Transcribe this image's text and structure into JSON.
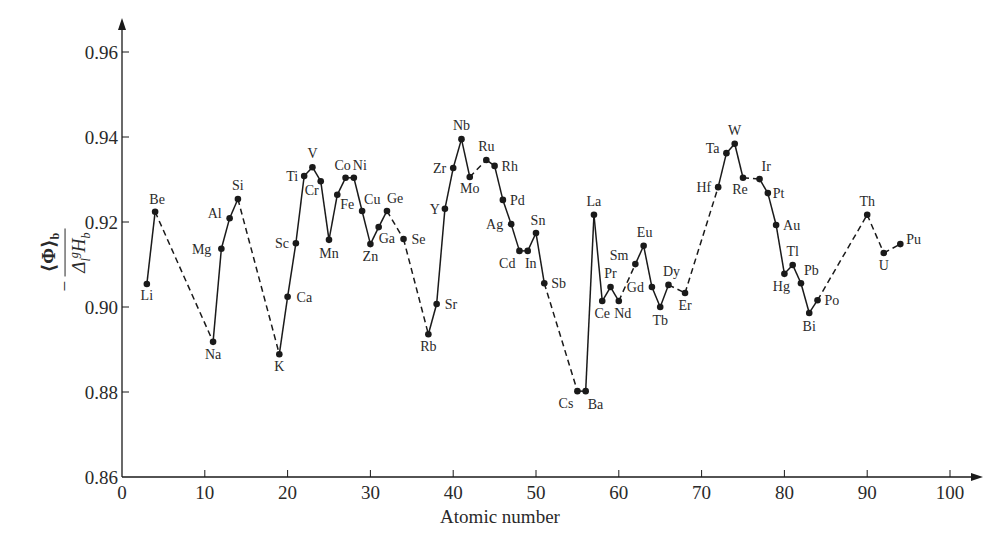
{
  "chart_data": {
    "type": "line",
    "title": "",
    "xlabel": "Atomic number",
    "ylabel": "−⟨Φ⟩_b / Δ_l^g H_b",
    "ylabel_parts": {
      "minus": "−",
      "numerator": "⟨Φ⟩",
      "numerator_sub": "b",
      "den_delta": "Δ",
      "den_sub": "l",
      "den_sup": "g",
      "den_H": "H",
      "den_H_sub": "b"
    },
    "xlim": [
      0,
      100
    ],
    "ylim": [
      0.86,
      0.96
    ],
    "xticks": [
      0,
      10,
      20,
      30,
      40,
      50,
      60,
      70,
      80,
      90,
      100
    ],
    "yticks": [
      0.86,
      0.88,
      0.9,
      0.92,
      0.94,
      0.96
    ],
    "ytick_labels": [
      "0.86",
      "0.88",
      "0.90",
      "0.92",
      "0.94",
      "0.96"
    ],
    "grid": false,
    "legend": null,
    "line_color": "#1a1a1a",
    "points": [
      {
        "el": "Li",
        "z": 3,
        "y": 0.9054,
        "lx": 0,
        "ly": 16,
        "dashed_to_next": false
      },
      {
        "el": "Be",
        "z": 4,
        "y": 0.9224,
        "lx": 2,
        "ly": -8,
        "dashed_to_next": true
      },
      {
        "el": "Na",
        "z": 11,
        "y": 0.8918,
        "lx": 0,
        "ly": 17,
        "dashed_to_next": false
      },
      {
        "el": "Mg",
        "z": 12,
        "y": 0.9137,
        "lx": -16,
        "ly": 5,
        "dashed_to_next": false
      },
      {
        "el": "Al",
        "z": 13,
        "y": 0.9209,
        "lx": -14,
        "ly": 0,
        "dashed_to_next": false
      },
      {
        "el": "Si",
        "z": 14,
        "y": 0.9254,
        "lx": 0,
        "ly": -9,
        "dashed_to_next": true
      },
      {
        "el": "K",
        "z": 19,
        "y": 0.8889,
        "lx": 0,
        "ly": 17,
        "dashed_to_next": false
      },
      {
        "el": "Ca",
        "z": 20,
        "y": 0.9024,
        "lx": 15,
        "ly": 5,
        "dashed_to_next": false
      },
      {
        "el": "Sc",
        "z": 21,
        "y": 0.915,
        "lx": -13,
        "ly": 5,
        "dashed_to_next": false
      },
      {
        "el": "Ti",
        "z": 22,
        "y": 0.9308,
        "lx": -12,
        "ly": 5,
        "dashed_to_next": false
      },
      {
        "el": "V",
        "z": 23,
        "y": 0.9329,
        "lx": 0,
        "ly": -9,
        "dashed_to_next": false
      },
      {
        "el": "Cr",
        "z": 24,
        "y": 0.9296,
        "lx": -8,
        "ly": 14,
        "dashed_to_next": false
      },
      {
        "el": "Mn",
        "z": 25,
        "y": 0.9158,
        "lx": 0,
        "ly": 18,
        "dashed_to_next": false
      },
      {
        "el": "Fe",
        "z": 26,
        "y": 0.9264,
        "lx": 9,
        "ly": 14,
        "dashed_to_next": false
      },
      {
        "el": "Co",
        "z": 27,
        "y": 0.9304,
        "lx": -3,
        "ly": -8,
        "dashed_to_next": false
      },
      {
        "el": "Ni",
        "z": 28,
        "y": 0.9304,
        "lx": 5,
        "ly": -8,
        "dashed_to_next": false
      },
      {
        "el": "Cu",
        "z": 29,
        "y": 0.9226,
        "lx": 8,
        "ly": -7,
        "dashed_to_next": false
      },
      {
        "el": "Zn",
        "z": 30,
        "y": 0.9148,
        "lx": 0,
        "ly": 17,
        "dashed_to_next": false
      },
      {
        "el": "Ga",
        "z": 31,
        "y": 0.9188,
        "lx": 6,
        "ly": 16,
        "dashed_to_next": false
      },
      {
        "el": "Ge",
        "z": 32,
        "y": 0.9226,
        "lx": 6,
        "ly": -8,
        "dashed_to_next": true
      },
      {
        "el": "Se",
        "z": 34,
        "y": 0.916,
        "lx": 14,
        "ly": 5,
        "dashed_to_next": true
      },
      {
        "el": "Rb",
        "z": 37,
        "y": 0.8936,
        "lx": 0,
        "ly": 17,
        "dashed_to_next": false
      },
      {
        "el": "Sr",
        "z": 38,
        "y": 0.9007,
        "lx": 14,
        "ly": 5,
        "dashed_to_next": false
      },
      {
        "el": "Y",
        "z": 39,
        "y": 0.9231,
        "lx": -11,
        "ly": 5,
        "dashed_to_next": false
      },
      {
        "el": "Zr",
        "z": 40,
        "y": 0.9327,
        "lx": -13,
        "ly": 5,
        "dashed_to_next": false
      },
      {
        "el": "Nb",
        "z": 41,
        "y": 0.9395,
        "lx": 0,
        "ly": -9,
        "dashed_to_next": false
      },
      {
        "el": "Mo",
        "z": 42,
        "y": 0.9306,
        "lx": 0,
        "ly": 16,
        "dashed_to_next": true
      },
      {
        "el": "Ru",
        "z": 44,
        "y": 0.9346,
        "lx": 0,
        "ly": -9,
        "dashed_to_next": false
      },
      {
        "el": "Rh",
        "z": 45,
        "y": 0.9332,
        "lx": 13,
        "ly": 5,
        "dashed_to_next": false
      },
      {
        "el": "Pd",
        "z": 46,
        "y": 0.9252,
        "lx": 13,
        "ly": 5,
        "dashed_to_next": false
      },
      {
        "el": "Ag",
        "z": 47,
        "y": 0.9195,
        "lx": -14,
        "ly": 5,
        "dashed_to_next": false
      },
      {
        "el": "Cd",
        "z": 48,
        "y": 0.9132,
        "lx": -10,
        "ly": 17,
        "dashed_to_next": false
      },
      {
        "el": "In",
        "z": 49,
        "y": 0.9132,
        "lx": 3,
        "ly": 17,
        "dashed_to_next": false
      },
      {
        "el": "Sn",
        "z": 50,
        "y": 0.9174,
        "lx": 2,
        "ly": -8,
        "dashed_to_next": false
      },
      {
        "el": "Sb",
        "z": 51,
        "y": 0.9056,
        "lx": 13,
        "ly": 5,
        "dashed_to_next": true
      },
      {
        "el": "Cs",
        "z": 55,
        "y": 0.8802,
        "lx": -10,
        "ly": 17,
        "dashed_to_next": false
      },
      {
        "el": "Ba",
        "z": 56,
        "y": 0.8802,
        "lx": 8,
        "ly": 18,
        "dashed_to_next": false
      },
      {
        "el": "La",
        "z": 57,
        "y": 0.9217,
        "lx": 0,
        "ly": -9,
        "dashed_to_next": false
      },
      {
        "el": "Ce",
        "z": 58,
        "y": 0.9014,
        "lx": 0,
        "ly": 17,
        "dashed_to_next": false
      },
      {
        "el": "Pr",
        "z": 59,
        "y": 0.9047,
        "lx": 0,
        "ly": -9,
        "dashed_to_next": false
      },
      {
        "el": "Nd",
        "z": 60,
        "y": 0.9014,
        "lx": 4,
        "ly": 17,
        "dashed_to_next": true
      },
      {
        "el": "Sm",
        "z": 62,
        "y": 0.9101,
        "lx": -13,
        "ly": -4,
        "dashed_to_next": false
      },
      {
        "el": "Eu",
        "z": 63,
        "y": 0.9144,
        "lx": 1,
        "ly": -9,
        "dashed_to_next": false
      },
      {
        "el": "Gd",
        "z": 64,
        "y": 0.9047,
        "lx": -14,
        "ly": 5,
        "dashed_to_next": false
      },
      {
        "el": "Tb",
        "z": 65,
        "y": 0.9,
        "lx": 0,
        "ly": 18,
        "dashed_to_next": false
      },
      {
        "el": "Dy",
        "z": 66,
        "y": 0.9052,
        "lx": 3,
        "ly": -9,
        "dashed_to_next": true
      },
      {
        "el": "Er",
        "z": 68,
        "y": 0.9033,
        "lx": 0,
        "ly": 17,
        "dashed_to_next": true
      },
      {
        "el": "Hf",
        "z": 72,
        "y": 0.9282,
        "lx": -13,
        "ly": 5,
        "dashed_to_next": false
      },
      {
        "el": "Ta",
        "z": 73,
        "y": 0.9362,
        "lx": -13,
        "ly": 0,
        "dashed_to_next": false
      },
      {
        "el": "W",
        "z": 74,
        "y": 0.9384,
        "lx": 0,
        "ly": -9,
        "dashed_to_next": false
      },
      {
        "el": "Re",
        "z": 75,
        "y": 0.9304,
        "lx": -3,
        "ly": 16,
        "dashed_to_next": true
      },
      {
        "el": "Ir",
        "z": 77,
        "y": 0.9301,
        "lx": 8,
        "ly": -8,
        "dashed_to_next": false
      },
      {
        "el": "Pt",
        "z": 78,
        "y": 0.9268,
        "lx": 11,
        "ly": 5,
        "dashed_to_next": false
      },
      {
        "el": "Au",
        "z": 79,
        "y": 0.9193,
        "lx": 13,
        "ly": 5,
        "dashed_to_next": false
      },
      {
        "el": "Hg",
        "z": 80,
        "y": 0.9078,
        "lx": -3,
        "ly": 17,
        "dashed_to_next": false
      },
      {
        "el": "Tl",
        "z": 81,
        "y": 0.9099,
        "lx": 0,
        "ly": -9,
        "dashed_to_next": false
      },
      {
        "el": "Pb",
        "z": 82,
        "y": 0.9056,
        "lx": 9,
        "ly": -8,
        "dashed_to_next": false
      },
      {
        "el": "Bi",
        "z": 83,
        "y": 0.8986,
        "lx": 0,
        "ly": 18,
        "dashed_to_next": false
      },
      {
        "el": "Po",
        "z": 84,
        "y": 0.9016,
        "lx": 13,
        "ly": 5,
        "dashed_to_next": true
      },
      {
        "el": "Th",
        "z": 90,
        "y": 0.9217,
        "lx": 0,
        "ly": -9,
        "dashed_to_next": true
      },
      {
        "el": "U",
        "z": 92,
        "y": 0.9127,
        "lx": 0,
        "ly": 17,
        "dashed_to_next": true
      },
      {
        "el": "Pu",
        "z": 94,
        "y": 0.9148,
        "lx": 12,
        "ly": 0,
        "dashed_to_next": false
      }
    ]
  },
  "layout": {
    "plot": {
      "x0": 122,
      "x100": 950,
      "y_min_px": 477,
      "y_max_px": 52,
      "axis_end_x": 983,
      "axis_top_y": 18
    }
  }
}
